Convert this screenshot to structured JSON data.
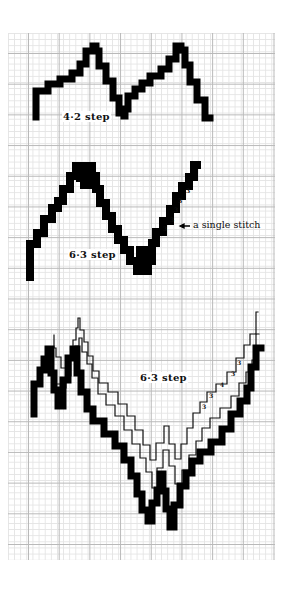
{
  "diagrams": [
    {
      "id": "four-two-step",
      "label": "4·2 step",
      "label_pos": [
        62,
        111
      ],
      "fill_color": "#000000",
      "bands": [
        {
          "style": "filled",
          "thickness": 7,
          "points": [
            [
              36,
              117
            ],
            [
              36,
              104
            ],
            [
              48,
              91
            ],
            [
              60,
              84
            ],
            [
              72,
              79
            ],
            [
              80,
              73
            ],
            [
              86,
              64
            ],
            [
              93,
              51
            ],
            [
              96,
              46
            ],
            [
              99,
              51
            ],
            [
              106,
              66
            ],
            [
              113,
              81
            ],
            [
              119,
              98
            ],
            [
              124,
              113
            ],
            [
              125,
              116
            ],
            [
              128,
              109
            ],
            [
              135,
              96
            ],
            [
              142,
              89
            ],
            [
              150,
              83
            ],
            [
              161,
              76
            ],
            [
              169,
              69
            ],
            [
              176,
              59
            ],
            [
              181,
              46
            ],
            [
              185,
              50
            ],
            [
              190,
              65
            ],
            [
              197,
              82
            ],
            [
              205,
              100
            ],
            [
              210,
              118
            ]
          ]
        }
      ]
    },
    {
      "id": "six-three-step-single",
      "label": "6·3 step",
      "label_pos": [
        68,
        249
      ],
      "annotation": "a single stitch",
      "annotation_pos": [
        193,
        219
      ],
      "arrow": [
        [
          180,
          226
        ],
        [
          190,
          226
        ]
      ],
      "step_numbers": [
        {
          "text": "3",
          "pos": [
            163,
            226
          ]
        },
        {
          "text": "3",
          "pos": [
            170,
            217
          ]
        },
        {
          "text": "3",
          "pos": [
            174,
            207
          ]
        },
        {
          "text": "3",
          "pos": [
            178,
            198
          ]
        },
        {
          "text": "3",
          "pos": [
            186,
            188
          ]
        }
      ],
      "bands": [
        {
          "style": "filled",
          "thickness": 8,
          "points": [
            [
              30,
              277
            ],
            [
              30,
              258
            ],
            [
              37,
              244
            ],
            [
              44,
              233
            ],
            [
              52,
              219
            ],
            [
              58,
              208
            ],
            [
              63,
              201
            ],
            [
              70,
              189
            ],
            [
              76,
              176
            ],
            [
              80,
              166
            ],
            [
              84,
              178
            ],
            [
              88,
              185
            ],
            [
              92,
              166
            ],
            [
              96,
              176
            ],
            [
              100,
              189
            ],
            [
              106,
              203
            ],
            [
              112,
              216
            ],
            [
              118,
              229
            ],
            [
              124,
              240
            ],
            [
              130,
              250
            ],
            [
              137,
              261
            ],
            [
              140,
              271
            ],
            [
              144,
              250
            ],
            [
              148,
              271
            ],
            [
              152,
              261
            ],
            [
              156,
              243
            ],
            [
              163,
              232
            ],
            [
              170,
              221
            ],
            [
              176,
              209
            ],
            [
              182,
              196
            ],
            [
              189,
              186
            ],
            [
              194,
              177
            ],
            [
              197,
              165
            ]
          ]
        }
      ]
    },
    {
      "id": "six-three-step-multirow",
      "label": "6·3 step",
      "label_pos": [
        139,
        372
      ],
      "step_numbers": [
        {
          "text": "3",
          "pos": [
            202,
            404
          ]
        },
        {
          "text": "3",
          "pos": [
            209,
            393
          ]
        },
        {
          "text": "4",
          "pos": [
            220,
            382
          ]
        },
        {
          "text": "3",
          "pos": [
            231,
            371
          ]
        },
        {
          "text": "3",
          "pos": [
            237,
            360
          ]
        }
      ],
      "bands": [
        {
          "style": "outline",
          "points": [
            [
              54,
              335
            ],
            [
              56,
              348
            ],
            [
              61,
              357
            ],
            [
              66,
              368
            ],
            [
              70,
              368
            ],
            [
              73,
              356
            ],
            [
              76,
              340
            ],
            [
              78,
              328
            ],
            [
              80,
              318
            ],
            [
              84,
              330
            ],
            [
              88,
              342
            ],
            [
              93,
              356
            ],
            [
              99,
              371
            ],
            [
              108,
              383
            ],
            [
              118,
              392
            ],
            [
              127,
              404
            ],
            [
              135,
              416
            ],
            [
              143,
              430
            ],
            [
              150,
              445
            ],
            [
              156,
              460
            ],
            [
              164,
              443
            ],
            [
              169,
              426
            ],
            [
              175,
              444
            ],
            [
              181,
              459
            ],
            [
              187,
              444
            ],
            [
              193,
              428
            ],
            [
              200,
              413
            ],
            [
              207,
              402
            ],
            [
              216,
              392
            ],
            [
              227,
              384
            ],
            [
              236,
              372
            ],
            [
              244,
              358
            ],
            [
              250,
              345
            ],
            [
              256,
              334
            ],
            [
              258,
              312
            ]
          ]
        },
        {
          "style": "outline",
          "points": [
            [
              47,
              349
            ],
            [
              50,
              360
            ],
            [
              55,
              372
            ],
            [
              61,
              384
            ],
            [
              66,
              388
            ],
            [
              71,
              376
            ],
            [
              75,
              360
            ],
            [
              79,
              346
            ],
            [
              82,
              338
            ],
            [
              87,
              352
            ],
            [
              92,
              364
            ],
            [
              98,
              378
            ],
            [
              106,
              394
            ],
            [
              115,
              405
            ],
            [
              124,
              416
            ],
            [
              132,
              430
            ],
            [
              140,
              444
            ],
            [
              146,
              458
            ],
            [
              152,
              472
            ],
            [
              157,
              488
            ],
            [
              163,
              468
            ],
            [
              169,
              450
            ],
            [
              175,
              466
            ],
            [
              182,
              484
            ],
            [
              189,
              470
            ],
            [
              196,
              455
            ],
            [
              202,
              441
            ],
            [
              210,
              428
            ],
            [
              220,
              418
            ],
            [
              231,
              408
            ],
            [
              239,
              396
            ],
            [
              246,
              383
            ],
            [
              252,
              372
            ],
            [
              256,
              360
            ],
            [
              259,
              334
            ]
          ]
        },
        {
          "style": "filled",
          "thickness": 7,
          "points": [
            [
              34,
              414
            ],
            [
              34,
              398
            ],
            [
              40,
              384
            ],
            [
              44,
              370
            ],
            [
              48,
              359
            ],
            [
              51,
              349
            ],
            [
              54,
              373
            ],
            [
              58,
              390
            ],
            [
              63,
              406
            ],
            [
              68,
              380
            ],
            [
              73,
              358
            ],
            [
              77,
              349
            ],
            [
              81,
              373
            ],
            [
              87,
              392
            ],
            [
              93,
              409
            ],
            [
              104,
              421
            ],
            [
              115,
              434
            ],
            [
              124,
              446
            ],
            [
              131,
              460
            ],
            [
              137,
              476
            ],
            [
              142,
              494
            ],
            [
              148,
              510
            ],
            [
              152,
              521
            ],
            [
              157,
              503
            ],
            [
              160,
              490
            ],
            [
              163,
              474
            ],
            [
              166,
              491
            ],
            [
              170,
              509
            ],
            [
              174,
              527
            ],
            [
              180,
              505
            ],
            [
              186,
              486
            ],
            [
              192,
              473
            ],
            [
              200,
              461
            ],
            [
              211,
              452
            ],
            [
              222,
              442
            ],
            [
              231,
              429
            ],
            [
              240,
              414
            ],
            [
              247,
              401
            ],
            [
              251,
              388
            ],
            [
              256,
              367
            ],
            [
              261,
              348
            ]
          ]
        }
      ]
    }
  ],
  "grid": {
    "minor_cell_px": 6.14,
    "major_every": 5,
    "minor_color": "#e4e4e4",
    "major_color": "#b9b9b9"
  }
}
